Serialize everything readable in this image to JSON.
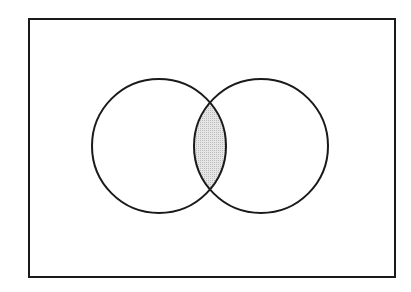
{
  "diagram": {
    "type": "venn",
    "universe": {
      "x": 29,
      "y": 19,
      "width": 366,
      "height": 258
    },
    "sets": [
      {
        "name": "A",
        "cx": 159,
        "cy": 146,
        "r": 67
      },
      {
        "name": "B",
        "cx": 261,
        "cy": 146,
        "r": 67
      }
    ],
    "shaded_region": "intersection",
    "colors": {
      "stroke": "#1a1a1a",
      "shade": "#d9d9d9",
      "background": "#ffffff"
    }
  }
}
